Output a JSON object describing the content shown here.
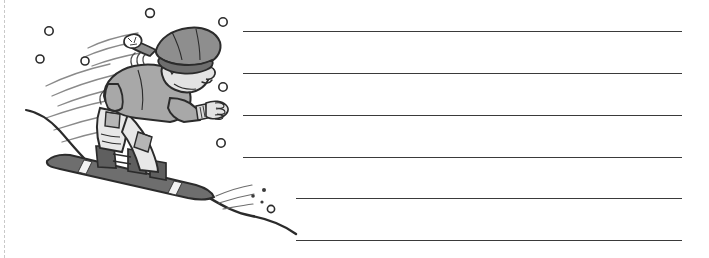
{
  "page": {
    "kind": "handwriting-worksheet",
    "background_color": "#ffffff",
    "width": 709,
    "height": 258
  },
  "margin_edge": {
    "name": "left-page-edge",
    "x": 4,
    "color": "#c9c9c9",
    "style": "dashed"
  },
  "illustration": {
    "title": "snowboarder",
    "description": "Cartoon snowboarder riding downhill with motion lines and falling snow",
    "colors": {
      "outline": "#2b2b2b",
      "hat": "#8e8e8e",
      "hat_dark": "#6e6e6e",
      "pompom": "#ffffff",
      "skin": "#e3e3e3",
      "jacket": "#a8a8a8",
      "pants": "#e8e8e8",
      "pocket": "#b5b5b5",
      "board": "#6e6e6e",
      "board_stripe": "#f2f2f2",
      "boots": "#5f5f5f",
      "snow": "#ffffff",
      "speed_line": "#8a8a8a"
    },
    "snow_circles": [
      {
        "cx": 49,
        "cy": 31,
        "r": 4.2
      },
      {
        "cx": 40,
        "cy": 59,
        "r": 4.0
      },
      {
        "cx": 85,
        "cy": 61,
        "r": 4.0
      },
      {
        "cx": 150,
        "cy": 13,
        "r": 4.4
      },
      {
        "cx": 223,
        "cy": 22,
        "r": 4.2
      },
      {
        "cx": 223,
        "cy": 87,
        "r": 4.2
      },
      {
        "cx": 221,
        "cy": 143,
        "r": 4.2
      },
      {
        "cx": 271,
        "cy": 209,
        "r": 3.6
      }
    ],
    "snow_specks": [
      {
        "cx": 253,
        "cy": 196,
        "r": 1.8
      },
      {
        "cx": 262,
        "cy": 202,
        "r": 1.6
      },
      {
        "cx": 264,
        "cy": 190,
        "r": 2.0
      }
    ]
  },
  "rules": {
    "label": "writing-lines",
    "color": "#3a3a3a",
    "thickness": 1.6,
    "lines": [
      {
        "index": 1,
        "x1": 243,
        "x2": 682,
        "y": 31
      },
      {
        "index": 2,
        "x1": 243,
        "x2": 682,
        "y": 73
      },
      {
        "index": 3,
        "x1": 243,
        "x2": 682,
        "y": 115
      },
      {
        "index": 4,
        "x1": 243,
        "x2": 682,
        "y": 157
      },
      {
        "index": 5,
        "x1": 296,
        "x2": 682,
        "y": 198
      },
      {
        "index": 6,
        "x1": 296,
        "x2": 682,
        "y": 240
      }
    ]
  }
}
